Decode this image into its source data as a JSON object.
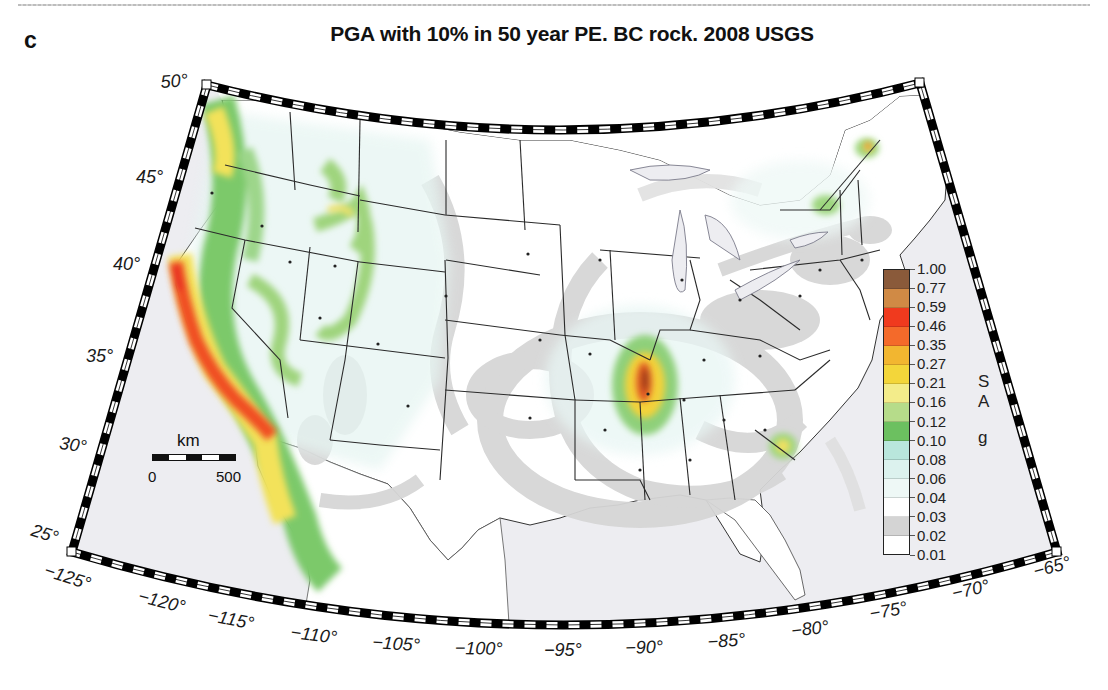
{
  "figure": {
    "panel_letter": "c",
    "title": "PGA with 10% in 50 year PE. BC rock. 2008 USGS"
  },
  "axes": {
    "latitude_labels": [
      {
        "text": "50°",
        "x": 160,
        "y": 72,
        "rot": -4
      },
      {
        "text": "45°",
        "x": 136,
        "y": 167,
        "rot": 0
      },
      {
        "text": "40°",
        "x": 113,
        "y": 254,
        "rot": 0
      },
      {
        "text": "35°",
        "x": 86,
        "y": 346,
        "rot": 0
      },
      {
        "text": "30°",
        "x": 61,
        "y": 433,
        "rot": 8
      },
      {
        "text": "25°",
        "x": 35,
        "y": 520,
        "rot": 18
      }
    ],
    "longitude_labels": [
      {
        "text": "−125°",
        "x": 48,
        "y": 560,
        "rot": 18
      },
      {
        "text": "−120°",
        "x": 141,
        "y": 586,
        "rot": 14
      },
      {
        "text": "−115°",
        "x": 210,
        "y": 605,
        "rot": 11
      },
      {
        "text": "−110°",
        "x": 292,
        "y": 622,
        "rot": 7
      },
      {
        "text": "−105°",
        "x": 373,
        "y": 632,
        "rot": 4
      },
      {
        "text": "−100°",
        "x": 455,
        "y": 638,
        "rot": 1
      },
      {
        "text": "−95°",
        "x": 544,
        "y": 640,
        "rot": 0
      },
      {
        "text": "−90°",
        "x": 625,
        "y": 638,
        "rot": -2
      },
      {
        "text": "−85°",
        "x": 707,
        "y": 632,
        "rot": -4
      },
      {
        "text": "−80°",
        "x": 790,
        "y": 621,
        "rot": -7
      },
      {
        "text": "−75°",
        "x": 868,
        "y": 604,
        "rot": -10
      },
      {
        "text": "−70°",
        "x": 950,
        "y": 584,
        "rot": -13
      },
      {
        "text": "−65°",
        "x": 1031,
        "y": 562,
        "rot": -15
      }
    ]
  },
  "legend": {
    "title_letters": [
      "S",
      "A",
      "g"
    ],
    "bins": [
      {
        "color": "#8a5a3a"
      },
      {
        "color": "#d08a45"
      },
      {
        "color": "#f03a1e"
      },
      {
        "color": "#f46a2a"
      },
      {
        "color": "#f2b630"
      },
      {
        "color": "#f3d63a"
      },
      {
        "color": "#f3ec8a"
      },
      {
        "color": "#b6dc8a"
      },
      {
        "color": "#6cc060"
      },
      {
        "color": "#b9e6dc"
      },
      {
        "color": "#dcf2ee"
      },
      {
        "color": "#eef8f6"
      },
      {
        "color": "#ffffff"
      },
      {
        "color": "#d4d4d4"
      },
      {
        "color": "#ffffff"
      }
    ],
    "ticks": [
      "1.00",
      "0.77",
      "0.59",
      "0.46",
      "0.35",
      "0.27",
      "0.21",
      "0.16",
      "0.12",
      "0.10",
      "0.08",
      "0.06",
      "0.04",
      "0.03",
      "0.02",
      "0.01"
    ]
  },
  "scale_bar": {
    "unit": "km",
    "start_label": "0",
    "end_label": "500"
  },
  "colors": {
    "ocean": "#ededf1",
    "land": "#ffffff",
    "low_hazard_gray": "#d6d6d6",
    "border": "#222222",
    "frame_black": "#000000"
  },
  "chart_data": {
    "type": "heatmap",
    "title": "PGA with 10% in 50 year PE. BC rock. 2008 USGS",
    "xlabel": "Longitude",
    "ylabel": "Latitude",
    "x_ticks": [
      "-125°",
      "-120°",
      "-115°",
      "-110°",
      "-105°",
      "-100°",
      "-95°",
      "-90°",
      "-85°",
      "-80°",
      "-75°",
      "-70°",
      "-65°"
    ],
    "y_ticks": [
      "25°",
      "30°",
      "35°",
      "40°",
      "45°",
      "50°"
    ],
    "xlim": [
      -125,
      -65
    ],
    "ylim": [
      25,
      50
    ],
    "colorbar": {
      "label": "SA g",
      "levels": [
        0.01,
        0.02,
        0.03,
        0.04,
        0.06,
        0.08,
        0.1,
        0.12,
        0.16,
        0.21,
        0.27,
        0.35,
        0.46,
        0.59,
        0.77,
        1.0
      ]
    },
    "high_hazard_regions": [
      {
        "name": "California coast / San Andreas",
        "approx_max": 0.77
      },
      {
        "name": "Pacific Northwest (Washington)",
        "approx_max": 0.35
      },
      {
        "name": "New Madrid (Missouri/Arkansas/Tennessee)",
        "approx_max": 0.77
      },
      {
        "name": "Charleston, South Carolina",
        "approx_max": 0.27
      },
      {
        "name": "Wasatch / Intermountain",
        "approx_max": 0.35
      },
      {
        "name": "St. Lawrence (Quebec)",
        "approx_max": 0.27
      }
    ],
    "scale_bar_km": [
      0,
      500
    ]
  }
}
